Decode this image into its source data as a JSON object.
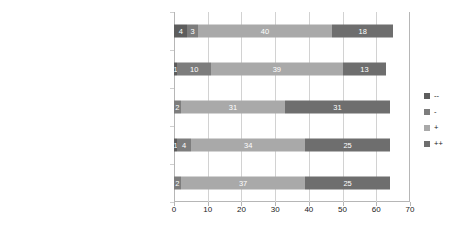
{
  "chart_data": {
    "type": "bar",
    "orientation": "horizontal",
    "stacked": true,
    "title": "",
    "subtitle": "",
    "xlabel": "",
    "ylabel": "",
    "xlim": [
      0,
      70
    ],
    "xticks": [
      0,
      10,
      20,
      30,
      40,
      50,
      60,
      70
    ],
    "xticklabels": [
      "0",
      "10",
      "20",
      "30",
      "40",
      "50",
      "60",
      "70"
    ],
    "grid": true,
    "grid_axis": "x",
    "legend_position": "right",
    "categories": [
      "(a) innovative solution",
      "(b) reduction of complexity",
      "(c) increase speed",
      "(d) forgetting nothing (completeness)",
      "(e) creative solutions"
    ],
    "series": [
      {
        "name": "--",
        "color": "#5d5d5d",
        "values": [
          0,
          1,
          0,
          1,
          4
        ],
        "labels": [
          "",
          "1",
          "",
          "1",
          "4"
        ]
      },
      {
        "name": "-",
        "color": "#7d7d7d",
        "values": [
          2,
          4,
          2,
          10,
          3
        ],
        "labels": [
          "2",
          "4",
          "2",
          "10",
          "3"
        ]
      },
      {
        "name": "+",
        "color": "#a9a9a9",
        "values": [
          37,
          34,
          31,
          39,
          40
        ],
        "labels": [
          "37",
          "34",
          "31",
          "39",
          "40"
        ]
      },
      {
        "name": "++",
        "color": "#6e6e6e",
        "values": [
          25,
          25,
          31,
          13,
          18
        ],
        "labels": [
          "25",
          "25",
          "31",
          "13",
          "18"
        ]
      }
    ],
    "totals": [
      64,
      64,
      64,
      63,
      65
    ]
  },
  "legend": {
    "items": [
      {
        "label": "--",
        "color": "#5d5d5d"
      },
      {
        "label": "-",
        "color": "#7d7d7d"
      },
      {
        "label": "+",
        "color": "#a9a9a9"
      },
      {
        "label": "++",
        "color": "#6e6e6e"
      }
    ]
  }
}
